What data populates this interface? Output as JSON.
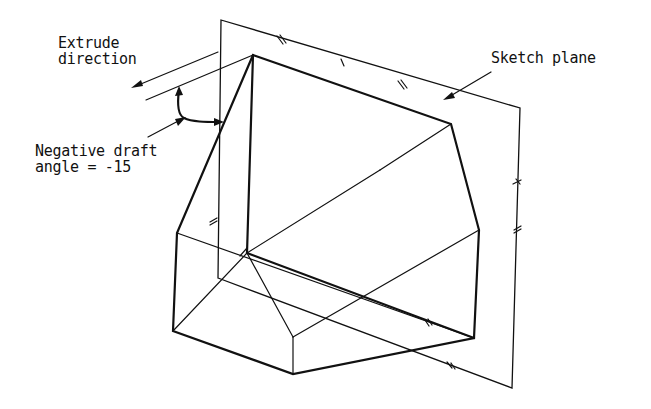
{
  "diagram": {
    "type": "technical-drawing",
    "labels": {
      "extrude_line1": "Extrude",
      "extrude_line2": "direction",
      "draft_line1": "Negative draft",
      "draft_line2": "angle = -15",
      "sketch_plane": "Sketch plane"
    },
    "draft_angle": -15,
    "colors": {
      "ink": "#111111",
      "background": "#ffffff"
    }
  }
}
